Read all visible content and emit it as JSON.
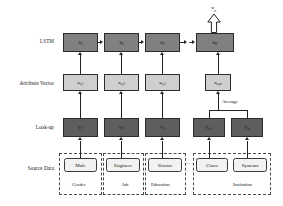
{
  "diagram": {
    "row_labels": [
      {
        "id": "lstm",
        "text": "LSTM"
      },
      {
        "id": "attribute-vector",
        "text": "Attribute Vector"
      },
      {
        "id": "look-up",
        "text": "Look-up"
      },
      {
        "id": "source-data",
        "text": "Source Data"
      }
    ],
    "output": {
      "label_main": "w",
      "label_sub": "u",
      "arrow": "hollow-up-arrow"
    },
    "lstm_nodes": [
      {
        "main": "h",
        "sub": "1"
      },
      {
        "main": "h",
        "sub": "2"
      },
      {
        "main": "h",
        "sub": "3"
      },
      {
        "main": "h",
        "sub": "N"
      }
    ],
    "attribute_nodes": [
      {
        "main": "a",
        "sub": "u,1"
      },
      {
        "main": "a",
        "sub": "u,2"
      },
      {
        "main": "a",
        "sub": "u,3"
      },
      {
        "main": "a",
        "sub": "u,m"
      }
    ],
    "lookup_nodes": [
      {
        "main": "V",
        "sub": "1"
      },
      {
        "main": "V",
        "sub": "2"
      },
      {
        "main": "V",
        "sub": "3"
      },
      {
        "main": "V",
        "sub": "n-1"
      },
      {
        "main": "V",
        "sub": "n"
      }
    ],
    "source_groups": [
      {
        "group_label": "Gender",
        "items": [
          "Male"
        ]
      },
      {
        "group_label": "Job",
        "items": [
          "Engineer"
        ]
      },
      {
        "group_label": "Education",
        "items": [
          "Doctor"
        ]
      },
      {
        "group_label": "Institution",
        "items": [
          "Cisco",
          "Systems"
        ]
      }
    ],
    "annotations": {
      "average": "Average",
      "ellipsis": "···"
    },
    "colors": {
      "lstm_fill": "#808080",
      "attribute_fill": "#cfcfcf",
      "lookup_fill": "#5e5e5e",
      "source_fill": "#f2f2f2",
      "stroke": "#2b2b2b",
      "dashed_stroke": "#4a4a4a"
    }
  }
}
